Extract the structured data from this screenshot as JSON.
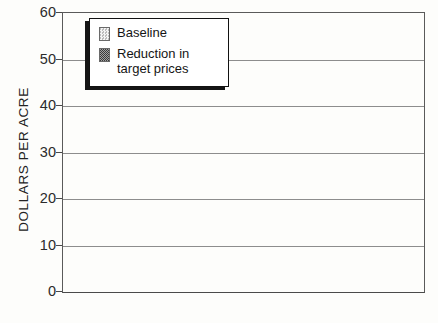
{
  "chart_data": {
    "type": "bar",
    "title": "",
    "subtitle": "",
    "xlabel": "",
    "ylabel": "DOLLARS PER ACRE",
    "categories": [
      "ALTERNATIVE",
      "CONVENTIONAL"
    ],
    "series": [
      {
        "name": "Baseline",
        "values": [
          41,
          60
        ],
        "clipped": [
          false,
          true
        ]
      },
      {
        "name": "Reduction in\ntarget prices",
        "values": [
          24,
          41.5
        ],
        "clipped": [
          false,
          false
        ]
      }
    ],
    "ylim": [
      0,
      60
    ],
    "ytick_labels": [
      "0",
      "10",
      "20",
      "30",
      "40",
      "50",
      "60"
    ],
    "ytick_values": [
      0,
      10,
      20,
      30,
      40,
      50,
      60
    ],
    "grid": true,
    "legend_position": "top-left",
    "colors": {
      "series_baseline": "#dedede",
      "series_reduction": "#6f6f6f",
      "axis": "#4a4a4a",
      "gridline": "#8d8d8d",
      "text": "#1f1f1f",
      "background": "#fdfdfb"
    }
  },
  "axis": {
    "y_title": "DOLLARS PER ACRE",
    "ticks": [
      {
        "label": "60",
        "value": 60
      },
      {
        "label": "50",
        "value": 50
      },
      {
        "label": "40",
        "value": 40
      },
      {
        "label": "30",
        "value": 30
      },
      {
        "label": "20",
        "value": 20
      },
      {
        "label": "10",
        "value": 10
      },
      {
        "label": "0",
        "value": 0
      }
    ]
  },
  "categories": [
    {
      "label": "ALTERNATIVE"
    },
    {
      "label": "CONVENTIONAL"
    }
  ],
  "legend": {
    "entries": [
      {
        "label": "Baseline",
        "swatch": "light-checker-swatch"
      },
      {
        "label": "Reduction in\ntarget prices",
        "swatch": "dark-checker-swatch"
      }
    ]
  },
  "bars": [
    {
      "group": "ALTERNATIVE",
      "series": "Baseline",
      "value": 41
    },
    {
      "group": "ALTERNATIVE",
      "series": "Reduction in target prices",
      "value": 24
    },
    {
      "group": "CONVENTIONAL",
      "series": "Baseline",
      "value": 60
    },
    {
      "group": "CONVENTIONAL",
      "series": "Reduction in target prices",
      "value": 41.5
    }
  ]
}
